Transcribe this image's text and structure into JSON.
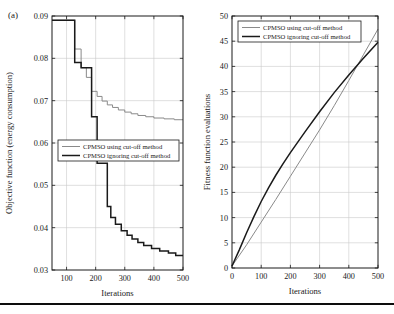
{
  "figure": {
    "panel_label": "(a)",
    "background": "#ffffff",
    "rule_color": "#0d0d0d"
  },
  "series_style": {
    "using_color": "#8a8a8a",
    "ignoring_color": "#1a1a1a",
    "using_width": 1.0,
    "ignoring_width": 1.5
  },
  "chart_data": [
    {
      "id": "left",
      "type": "line",
      "title": "",
      "xlabel": "Iterations",
      "ylabel": "Objective function (energy consumption)",
      "xlim": [
        50,
        500
      ],
      "ylim": [
        0.03,
        0.09
      ],
      "xticks": [
        100,
        200,
        300,
        400,
        500
      ],
      "yticks": [
        0.03,
        0.04,
        0.05,
        0.06,
        0.07,
        0.08,
        0.09
      ],
      "xticklabels": [
        "100",
        "200",
        "300",
        "400",
        "500"
      ],
      "yticklabels": [
        "0.03",
        "0.04",
        "0.05",
        "0.06",
        "0.07",
        "0.08",
        "0.09"
      ],
      "grid": true,
      "step": true,
      "legend_position": "lower-left",
      "legend": [
        "CPMSO using cut-off method",
        "CPMSO ignoring cut-off method"
      ],
      "series": [
        {
          "name": "CPMSO using cut-off method",
          "color": "#8a8a8a",
          "x": [
            50,
            128,
            128,
            150,
            150,
            168,
            168,
            186,
            186,
            205,
            205,
            222,
            222,
            240,
            240,
            258,
            258,
            278,
            278,
            300,
            300,
            322,
            322,
            345,
            345,
            372,
            372,
            400,
            400,
            435,
            435,
            470,
            470,
            500
          ],
          "y": [
            0.089,
            0.089,
            0.0822,
            0.0822,
            0.0778,
            0.0778,
            0.0755,
            0.0755,
            0.0722,
            0.0722,
            0.071,
            0.071,
            0.0699,
            0.0699,
            0.069,
            0.069,
            0.0684,
            0.0684,
            0.0678,
            0.0678,
            0.0673,
            0.0673,
            0.0669,
            0.0669,
            0.0665,
            0.0665,
            0.0662,
            0.0662,
            0.0659,
            0.0659,
            0.0657,
            0.0657,
            0.0655,
            0.0655
          ]
        },
        {
          "name": "CPMSO ignoring cut-off method",
          "color": "#1a1a1a",
          "x": [
            50,
            128,
            128,
            150,
            150,
            186,
            186,
            205,
            205,
            240,
            240,
            252,
            252,
            268,
            268,
            288,
            288,
            308,
            308,
            325,
            325,
            345,
            345,
            365,
            365,
            392,
            392,
            420,
            420,
            450,
            450,
            475,
            475,
            500
          ],
          "y": [
            0.089,
            0.089,
            0.079,
            0.079,
            0.0778,
            0.0778,
            0.0662,
            0.0662,
            0.0552,
            0.0552,
            0.045,
            0.045,
            0.0424,
            0.0424,
            0.0408,
            0.0408,
            0.0393,
            0.0393,
            0.0382,
            0.0382,
            0.0373,
            0.0373,
            0.0365,
            0.0365,
            0.0358,
            0.0358,
            0.0351,
            0.0351,
            0.0345,
            0.0345,
            0.034,
            0.034,
            0.0334,
            0.0334
          ]
        }
      ]
    },
    {
      "id": "right",
      "type": "line",
      "title": "",
      "xlabel": "Iterations",
      "ylabel": "Fitness function evaluations",
      "xlim": [
        0,
        500
      ],
      "ylim": [
        0,
        50
      ],
      "xticks": [
        0,
        100,
        200,
        300,
        400,
        500
      ],
      "yticks": [
        0,
        5,
        10,
        15,
        20,
        25,
        30,
        35,
        40,
        45,
        50
      ],
      "xticklabels": [
        "0",
        "100",
        "200",
        "300",
        "400",
        "500"
      ],
      "yticklabels": [
        "0",
        "5",
        "10",
        "15",
        "20",
        "25",
        "30",
        "35",
        "40",
        "45",
        "50"
      ],
      "grid": true,
      "step": false,
      "legend_position": "upper-left",
      "legend": [
        "CPMSO using cut-off method",
        "CPMSO ignoring cut-off method"
      ],
      "series": [
        {
          "name": "CPMSO using cut-off method",
          "color": "#8a8a8a",
          "x": [
            0,
            50,
            100,
            150,
            200,
            250,
            300,
            350,
            400,
            450,
            500
          ],
          "y": [
            0.4,
            4.6,
            9.1,
            13.6,
            18.2,
            22.8,
            27.4,
            32.2,
            37.2,
            42.3,
            47.4
          ]
        },
        {
          "name": "CPMSO ignoring cut-off method",
          "color": "#1a1a1a",
          "x": [
            0,
            25,
            50,
            75,
            100,
            125,
            150,
            175,
            200,
            250,
            300,
            350,
            400,
            450,
            500
          ],
          "y": [
            0.4,
            3.6,
            7.0,
            10.2,
            13.2,
            15.9,
            18.4,
            20.7,
            22.9,
            27.0,
            31.0,
            34.8,
            38.3,
            41.6,
            44.8
          ]
        }
      ]
    }
  ]
}
